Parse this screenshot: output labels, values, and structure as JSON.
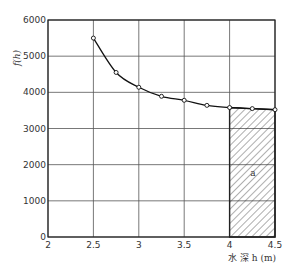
{
  "chart_data": {
    "type": "line",
    "title": "",
    "xlabel": "水 深 h (m)",
    "ylabel": "f(h)",
    "xlim": [
      2,
      4.5
    ],
    "ylim": [
      0,
      6000
    ],
    "xticks": [
      "2",
      "2.5",
      "3",
      "3.5",
      "4",
      "4.5"
    ],
    "yticks": [
      "0",
      "1000",
      "2000",
      "3000",
      "4000",
      "5000",
      "6000"
    ],
    "grid": true,
    "legend": null,
    "series": [
      {
        "name": "f(h)",
        "x": [
          2.5,
          2.75,
          3.0,
          3.25,
          3.5,
          3.75,
          4.0,
          4.25,
          4.5
        ],
        "values": [
          5500,
          4550,
          4140,
          3890,
          3780,
          3640,
          3580,
          3550,
          3520
        ],
        "marker": "open-circle"
      }
    ],
    "annotations": [
      {
        "type": "hatched-area",
        "x_from": 4.0,
        "x_to": 4.5,
        "label": "a"
      }
    ]
  }
}
